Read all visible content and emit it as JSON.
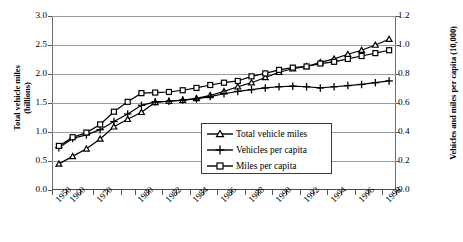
{
  "chart_data": {
    "type": "line",
    "title": "",
    "xlabel": "",
    "ylabel": "Total vehicle miles (billions)",
    "ylabel_right": "Vehicles and miles per capita (10,000)",
    "grid": true,
    "legend_position": "center-right-inside",
    "ylim": [
      0.0,
      3.0
    ],
    "ylim_right": [
      0.0,
      1.2
    ],
    "yticks": [
      "0.0",
      "0.5",
      "1.0",
      "1.5",
      "2.0",
      "2.5",
      "3.0"
    ],
    "yticks_right": [
      "0.0",
      "0.2",
      "0.4",
      "0.6",
      "0.8",
      "1.0",
      "1.2"
    ],
    "x": [
      1950,
      1960,
      1965,
      1970,
      1975,
      1978,
      1980,
      1981,
      1982,
      1983,
      1984,
      1985,
      1986,
      1987,
      1988,
      1989,
      1990,
      1991,
      1992,
      1993,
      1994,
      1995,
      1996,
      1997,
      1998
    ],
    "xtick_labels": [
      "1950",
      "1960",
      "1970",
      "1980",
      "1982",
      "1984",
      "1986",
      "1988",
      "1990",
      "1992",
      "1994",
      "1996",
      "1998"
    ],
    "series": [
      {
        "name": "Total vehicle miles",
        "marker": "triangle",
        "axis": "left",
        "values": [
          0.45,
          0.58,
          0.71,
          0.88,
          1.09,
          1.22,
          1.34,
          1.51,
          1.53,
          1.55,
          1.58,
          1.63,
          1.7,
          1.78,
          1.85,
          1.94,
          2.03,
          2.09,
          2.13,
          2.2,
          2.26,
          2.34,
          2.41,
          2.5,
          2.6
        ]
      },
      {
        "name": "Vehicles per capita",
        "marker": "plus",
        "axis": "left",
        "values": [
          0.73,
          0.89,
          0.95,
          1.04,
          1.18,
          1.31,
          1.46,
          1.52,
          1.53,
          1.55,
          1.57,
          1.61,
          1.66,
          1.7,
          1.73,
          1.76,
          1.78,
          1.79,
          1.78,
          1.76,
          1.78,
          1.8,
          1.82,
          1.85,
          1.88
        ]
      },
      {
        "name": "Miles  per  capita",
        "marker": "square",
        "axis": "left",
        "values": [
          0.76,
          0.91,
          0.99,
          1.13,
          1.35,
          1.52,
          1.67,
          1.68,
          1.69,
          1.72,
          1.76,
          1.81,
          1.85,
          1.88,
          1.96,
          2.01,
          2.07,
          2.11,
          2.13,
          2.18,
          2.21,
          2.26,
          2.31,
          2.36,
          2.41
        ]
      }
    ]
  },
  "axis": {
    "left_title_line1": "Total vehicle miles",
    "left_title_line2": "(billions)",
    "right_title": "Vehicles and miles per capita (10,000)"
  },
  "legend": {
    "items": [
      {
        "label": "Total vehicle miles",
        "marker": "triangle-marker-icon"
      },
      {
        "label": "Vehicles per capita",
        "marker": "plus-marker-icon"
      },
      {
        "label": "Miles  per  capita",
        "marker": "square-marker-icon"
      }
    ]
  }
}
